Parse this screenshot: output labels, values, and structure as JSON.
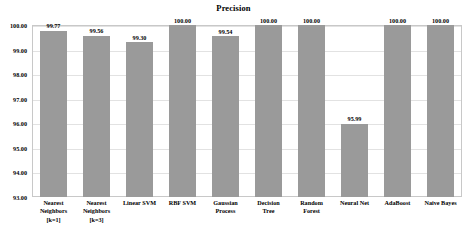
{
  "chart_data": {
    "type": "bar",
    "title": "Precision",
    "xlabel": "",
    "ylabel": "",
    "ylim": [
      93.0,
      100.0
    ],
    "ytick_labels": [
      "100.00",
      "99.00",
      "98.00",
      "97.00",
      "96.00",
      "95.00",
      "94.00",
      "93.00"
    ],
    "yticks": [
      100.0,
      99.0,
      98.0,
      97.0,
      96.0,
      95.0,
      94.0,
      93.0
    ],
    "grid": true,
    "legend": "none",
    "bar_color": "#9a9a9a",
    "categories": [
      "Nearest Neighbors [k=1]",
      "Nearest Neighbors [k=3]",
      "Linear SVM",
      "RBF SVM",
      "Gaussian Process",
      "Decision Tree",
      "Random Forest",
      "Neural Net",
      "AdaBoost",
      "Naive Bayes"
    ],
    "category_lines": [
      [
        "Nearest",
        "Neighbors",
        "[k=1]"
      ],
      [
        "Nearest",
        "Neighbors",
        "[k=3]"
      ],
      [
        "Linear SVM"
      ],
      [
        "RBF SVM"
      ],
      [
        "Gaussian",
        "Process"
      ],
      [
        "Decision",
        "Tree"
      ],
      [
        "Random",
        "Forest"
      ],
      [
        "Neural Net"
      ],
      [
        "AdaBoost"
      ],
      [
        "Naive Bayes"
      ]
    ],
    "values": [
      99.77,
      99.56,
      99.3,
      100.0,
      99.54,
      100.0,
      100.0,
      95.99,
      100.0,
      100.0
    ],
    "value_labels": [
      "99.77",
      "99.56",
      "99.30",
      "100.00",
      "99.54",
      "100.00",
      "100.00",
      "95.99",
      "100.00",
      "100.00"
    ]
  }
}
